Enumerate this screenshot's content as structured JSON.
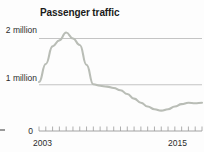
{
  "chart_data": {
    "type": "line",
    "title": "Passenger traffic",
    "xlabel": "",
    "ylabel": "",
    "grid": true,
    "legend": false,
    "xlim": [
      2003,
      2015
    ],
    "ylim": [
      0,
      2400000
    ],
    "x_tick_labels": [
      "2003",
      "2015"
    ],
    "y_tick_labels": [
      "0",
      "1 million",
      "2 million"
    ],
    "y_tick_values": [
      0,
      1000000,
      2000000
    ],
    "gridlines_at": [
      1000000,
      2000000
    ],
    "minor_x_ticks": 24,
    "series": [
      {
        "name": "Passenger traffic",
        "color": "#b9bdb6",
        "x": [
          2003,
          2003.5,
          2004,
          2004.5,
          2005,
          2005.5,
          2006,
          2006.5,
          2007,
          2007.5,
          2008,
          2008.5,
          2009,
          2009.5,
          2010,
          2010.5,
          2011,
          2011.5,
          2012,
          2012.5,
          2013,
          2013.5,
          2014,
          2014.5,
          2015
        ],
        "values": [
          1060000,
          1450000,
          1830000,
          1960000,
          2130000,
          2000000,
          1860000,
          1430000,
          1010000,
          980000,
          960000,
          930000,
          880000,
          800000,
          700000,
          610000,
          530000,
          470000,
          440000,
          470000,
          530000,
          580000,
          610000,
          600000,
          610000
        ]
      }
    ],
    "annotations": []
  },
  "chart": {
    "title": "Passenger traffic",
    "y_axis": {
      "label_2m": "2 million",
      "label_1m": "1 million",
      "label_0": "0"
    },
    "x_axis": {
      "start": "2003",
      "end": "2015"
    },
    "colors": {
      "line": "#b9bdb6",
      "gridline": "#b5b5b5",
      "axis": "#8a8a8a",
      "text": "#2b2b2b",
      "background": "#fdfdfd"
    }
  }
}
